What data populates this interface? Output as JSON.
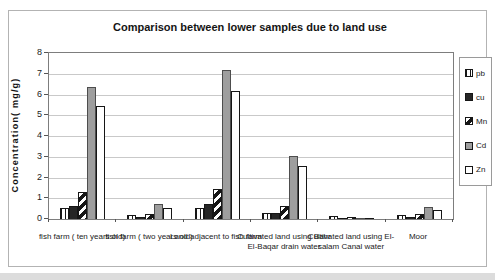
{
  "chart_data": {
    "type": "bar",
    "title": "Comparison between lower samples due to land use",
    "xlabel": "",
    "ylabel": "Concentration( mg/g)",
    "ylim": [
      0,
      8
    ],
    "yticks": [
      0,
      1,
      2,
      3,
      4,
      5,
      6,
      7,
      8
    ],
    "grid": "horizontal",
    "legend_position": "right",
    "colors": {
      "solid_dark": "#262626",
      "solid_gray": "#9e9e9e",
      "bar_outline": "#161616",
      "gridline": "#c9c9c9"
    },
    "categories": [
      "fish farm ( ten years old)",
      "fish farm ( two years old)",
      "Land adjacent to fish farm",
      "Cultivated land using Bahr El-Baqar drain water",
      "Cultivated land using El-salam Canal water",
      "Moor"
    ],
    "series": [
      {
        "name": "pb",
        "pattern": "vertical-stripes",
        "values": [
          0.55,
          0.2,
          0.55,
          0.3,
          0.13,
          0.2
        ]
      },
      {
        "name": "cu",
        "pattern": "solid-dark",
        "color": "#262626",
        "values": [
          0.65,
          0.12,
          0.7,
          0.3,
          0.04,
          0.08
        ]
      },
      {
        "name": "Mn",
        "pattern": "diagonal-stripes",
        "values": [
          1.3,
          0.22,
          1.45,
          0.65,
          0.08,
          0.22
        ]
      },
      {
        "name": "Cd",
        "pattern": "solid-gray",
        "color": "#9e9e9e",
        "values": [
          6.35,
          0.7,
          7.2,
          3.05,
          0.05,
          0.6
        ]
      },
      {
        "name": "Zn",
        "pattern": "outline-white",
        "color": "#ffffff",
        "values": [
          5.45,
          0.55,
          6.15,
          2.55,
          0.03,
          0.45
        ]
      }
    ]
  }
}
